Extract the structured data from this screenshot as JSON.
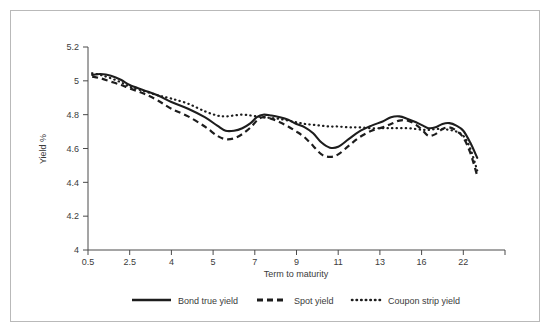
{
  "chart_data": {
    "type": "line",
    "title": "",
    "xlabel": "Term to maturity",
    "ylabel": "Yield %",
    "grid": false,
    "legend_position": "bottom",
    "ylim": [
      4,
      5.2
    ],
    "yticks": [
      "4",
      "4.2",
      "4.4",
      "4.6",
      "4.8",
      "5",
      "5.2"
    ],
    "ytick_values": [
      4,
      4.2,
      4.4,
      4.6,
      4.8,
      5,
      5.2
    ],
    "categories": [
      "0.5",
      "2.5",
      "4",
      "5",
      "7",
      "9",
      "11",
      "13",
      "16",
      "22"
    ],
    "x": [
      0.5,
      2.5,
      4,
      5,
      7,
      9,
      11,
      13,
      16,
      22
    ],
    "series": [
      {
        "name": "Bond true yield",
        "style": "solid",
        "color": "#1d1d1d",
        "x": [
          0.7,
          1.1,
          1.6,
          2.1,
          2.5,
          3.0,
          3.5,
          4.0,
          4.4,
          4.8,
          5.2,
          5.6,
          6.0,
          6.4,
          6.8,
          7.1,
          7.4,
          7.8,
          8.2,
          8.6,
          9.0,
          9.4,
          9.8,
          10.2,
          10.6,
          11.0,
          11.5,
          12.0,
          12.6,
          13.2,
          13.8,
          14.4,
          15.0,
          15.6,
          16.2,
          17.0,
          18.0,
          19.0,
          20.0,
          21.0,
          22.0,
          23.0,
          24.0
        ],
        "values": [
          5.035,
          5.04,
          5.03,
          5.005,
          4.975,
          4.945,
          4.915,
          4.875,
          4.835,
          4.785,
          4.735,
          4.705,
          4.705,
          4.72,
          4.75,
          4.785,
          4.8,
          4.795,
          4.785,
          4.77,
          4.745,
          4.725,
          4.69,
          4.635,
          4.605,
          4.61,
          4.655,
          4.7,
          4.735,
          4.76,
          4.785,
          4.79,
          4.775,
          4.755,
          4.735,
          4.72,
          4.725,
          4.745,
          4.75,
          4.735,
          4.705,
          4.635,
          4.545
        ]
      },
      {
        "name": "Spot yield",
        "style": "dashed",
        "color": "#1d1d1d",
        "x": [
          0.7,
          1.1,
          1.6,
          2.1,
          2.5,
          3.0,
          3.5,
          4.0,
          4.4,
          4.8,
          5.2,
          5.6,
          6.0,
          6.4,
          6.8,
          7.1,
          7.4,
          7.8,
          8.2,
          8.6,
          9.0,
          9.4,
          9.8,
          10.2,
          10.6,
          11.0,
          11.5,
          12.0,
          12.6,
          13.2,
          13.8,
          14.4,
          15.0,
          15.6,
          16.2,
          17.0,
          18.0,
          19.0,
          20.0,
          21.0,
          22.0,
          23.0,
          24.0
        ],
        "values": [
          5.025,
          5.015,
          4.995,
          4.975,
          4.955,
          4.925,
          4.885,
          4.835,
          4.79,
          4.73,
          4.675,
          4.655,
          4.66,
          4.685,
          4.725,
          4.765,
          4.785,
          4.775,
          4.755,
          4.73,
          4.7,
          4.665,
          4.615,
          4.565,
          4.55,
          4.565,
          4.615,
          4.665,
          4.705,
          4.725,
          4.745,
          4.765,
          4.765,
          4.74,
          4.705,
          4.675,
          4.685,
          4.715,
          4.725,
          4.705,
          4.665,
          4.575,
          4.44
        ]
      },
      {
        "name": "Coupon strip yield",
        "style": "dotted",
        "color": "#1d1d1d",
        "x": [
          0.7,
          1.1,
          1.6,
          2.1,
          2.5,
          3.0,
          3.5,
          4.0,
          4.4,
          4.8,
          5.2,
          5.6,
          6.0,
          6.4,
          6.8,
          7.1,
          7.4,
          7.8,
          8.2,
          8.6,
          9.0,
          9.4,
          9.8,
          10.2,
          10.6,
          11.0,
          11.5,
          12.0,
          12.6,
          13.2,
          13.8,
          14.4,
          15.0,
          15.6,
          16.2,
          17.0,
          18.0,
          19.0,
          20.0,
          21.0,
          22.0,
          23.0,
          24.0
        ],
        "values": [
          5.045,
          5.035,
          5.015,
          4.99,
          4.965,
          4.94,
          4.915,
          4.895,
          4.865,
          4.82,
          4.795,
          4.79,
          4.795,
          4.8,
          4.795,
          4.79,
          4.785,
          4.78,
          4.775,
          4.765,
          4.755,
          4.745,
          4.74,
          4.735,
          4.73,
          4.73,
          4.725,
          4.725,
          4.72,
          4.72,
          4.72,
          4.72,
          4.72,
          4.715,
          4.71,
          4.71,
          4.715,
          4.715,
          4.71,
          4.7,
          4.675,
          4.6,
          4.47
        ]
      }
    ]
  },
  "legend": {
    "items": [
      {
        "label": "Bond true yield"
      },
      {
        "label": "Spot yield"
      },
      {
        "label": "Coupon strip yield"
      }
    ]
  }
}
